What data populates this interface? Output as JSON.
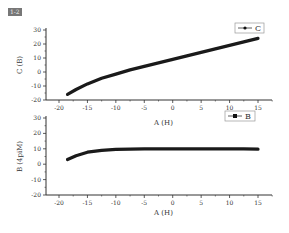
{
  "figure_label": "1-2",
  "chart_data": [
    {
      "type": "line",
      "title": "",
      "xlabel": "A (H)",
      "ylabel": "C (B)",
      "xlim": [
        -21,
        17.5
      ],
      "ylim": [
        -20,
        30
      ],
      "xticks": [
        -20,
        -15,
        -10,
        -5,
        0,
        5,
        10,
        15
      ],
      "yticks": [
        30,
        20,
        10,
        0,
        -10,
        -20
      ],
      "grid": false,
      "legend_position": "top-right",
      "series": [
        {
          "name": "C",
          "marker": "circle",
          "x": [
            -18.5,
            -17,
            -15,
            -12.5,
            -10,
            -7.5,
            -5,
            -2.5,
            0,
            2.5,
            5,
            7.5,
            10,
            12.5,
            15
          ],
          "y": [
            -16,
            -12.5,
            -8.5,
            -4.5,
            -1.5,
            1.5,
            4,
            6.5,
            9,
            11.5,
            14,
            16.5,
            19,
            21.5,
            24
          ]
        }
      ]
    },
    {
      "type": "line",
      "title": "",
      "xlabel": "A (H)",
      "ylabel": "B (4piM)",
      "xlim": [
        -21,
        17.5
      ],
      "ylim": [
        -20,
        30
      ],
      "xticks": [
        -20,
        -15,
        -10,
        -5,
        0,
        5,
        10,
        15
      ],
      "yticks": [
        30,
        20,
        10,
        0,
        -10,
        -20
      ],
      "grid": false,
      "legend_position": "top-right",
      "series": [
        {
          "name": "B",
          "marker": "square",
          "x": [
            -18.5,
            -17,
            -15,
            -12.5,
            -10,
            -7.5,
            -5,
            -2.5,
            0,
            2.5,
            5,
            7.5,
            10,
            12.5,
            15
          ],
          "y": [
            3,
            5.5,
            7.8,
            9,
            9.6,
            9.8,
            9.9,
            10,
            10,
            10,
            10,
            10,
            9.9,
            9.9,
            9.8
          ]
        }
      ]
    }
  ]
}
